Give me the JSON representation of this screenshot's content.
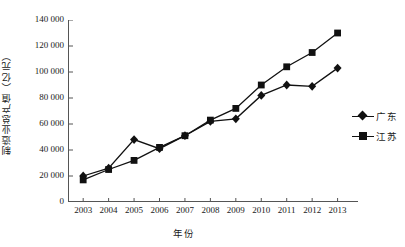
{
  "chart_data": {
    "type": "line",
    "title": "",
    "xlabel": "年份",
    "ylabel": "制造业总产值（亿元）",
    "categories": [
      "2003",
      "2004",
      "2005",
      "2006",
      "2007",
      "2008",
      "2009",
      "2010",
      "2011",
      "2012",
      "2013"
    ],
    "x": [
      2003,
      2004,
      2005,
      2006,
      2007,
      2008,
      2009,
      2010,
      2011,
      2012,
      2013
    ],
    "series": [
      {
        "name": "广东",
        "marker": "diamond",
        "color": "#111111",
        "values": [
          20000,
          26000,
          48000,
          41000,
          51000,
          62000,
          64000,
          82000,
          90000,
          89000,
          103000
        ]
      },
      {
        "name": "江苏",
        "marker": "square",
        "color": "#111111",
        "values": [
          17000,
          25000,
          32000,
          42000,
          51000,
          63000,
          72000,
          90000,
          104000,
          115000,
          130000
        ]
      }
    ],
    "ylim": [
      0,
      140000
    ],
    "yticks": [
      0,
      20000,
      40000,
      60000,
      80000,
      100000,
      120000,
      140000
    ],
    "ytick_labels": [
      "0",
      "20 000",
      "40 000",
      "60 000",
      "80 000",
      "100 000",
      "120 000",
      "140 000"
    ],
    "grid": false,
    "legend_position": "right"
  },
  "legend": {
    "entries": [
      {
        "label": "广东",
        "marker": "diamond"
      },
      {
        "label": "江苏",
        "marker": "square"
      }
    ]
  },
  "axes": {
    "y_title": "制造业总产值（亿元）",
    "x_title": "年份"
  }
}
